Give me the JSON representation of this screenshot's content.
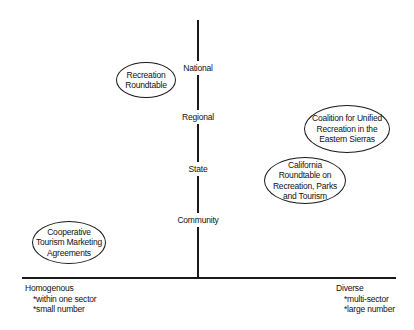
{
  "vertical_axis": {
    "levels": [
      {
        "label": "National"
      },
      {
        "label": "Regional"
      },
      {
        "label": "State"
      },
      {
        "label": "Community"
      }
    ]
  },
  "horizontal_axis": {
    "left": {
      "title": "Homogenous",
      "bullets": [
        "*within one sector",
        "*small number"
      ]
    },
    "right": {
      "title": "Diverse",
      "bullets": [
        "*multi-sector",
        "*large number"
      ]
    }
  },
  "nodes": [
    {
      "label": "Recreation\nRoundtable"
    },
    {
      "label": "Coalition for Unified\nRecreation in the\nEastern Sierras"
    },
    {
      "label": "California\nRoundtable on\nRecreation, Parks\nand Tourism"
    },
    {
      "label": "Cooperative\nTourism Marketing\nAgreements"
    }
  ]
}
